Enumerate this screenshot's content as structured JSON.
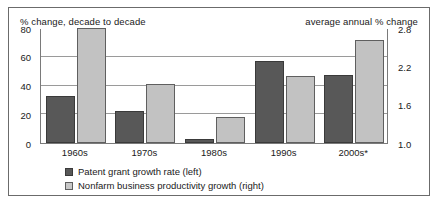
{
  "chart_data": {
    "type": "bar",
    "title": "",
    "categories": [
      "1960s",
      "1970s",
      "1980s",
      "1990s",
      "2000s*"
    ],
    "series": [
      {
        "name": "Patent grant growth rate (left)",
        "axis": "left",
        "color": "#585858",
        "values": [
          33,
          22,
          3,
          57,
          47
        ]
      },
      {
        "name": "Nonfarm business productivity growth (right)",
        "axis": "right",
        "color": "#c2c2c2",
        "values": [
          2.8,
          1.93,
          1.4,
          2.05,
          2.62
        ]
      }
    ],
    "left_axis": {
      "label": "% change, decade to decade",
      "ticks": [
        "0",
        "20",
        "40",
        "60",
        "80"
      ],
      "tick_values": [
        0,
        20,
        40,
        60,
        80
      ],
      "ylim": [
        0,
        80
      ]
    },
    "right_axis": {
      "label": "average annual % change",
      "ticks": [
        "1.0",
        "1.6",
        "2.2",
        "2.8"
      ],
      "tick_values": [
        1.0,
        1.6,
        2.2,
        2.8
      ],
      "ylim": [
        1.0,
        2.8
      ]
    },
    "xlabel": "",
    "grid": true,
    "legend_position": "bottom-left"
  },
  "captions": {
    "left": "% change, decade to decade",
    "right": "average annual % change"
  },
  "legend": {
    "items": [
      {
        "label": "Patent grant growth rate (left)",
        "swatch": "dark"
      },
      {
        "label": "Nonfarm business productivity growth (right)",
        "swatch": "light"
      }
    ]
  }
}
